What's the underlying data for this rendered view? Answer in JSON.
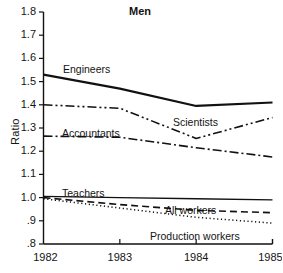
{
  "chart_data": {
    "type": "line",
    "title": "Men",
    "xlabel": "",
    "ylabel": "Ratio",
    "x": [
      1982,
      1983,
      1984,
      1985
    ],
    "xtick_labels": [
      "1982",
      "1983",
      "1984",
      "1985"
    ],
    "ylim": [
      0.8,
      1.8
    ],
    "ytick_values": [
      1.8,
      1.7,
      1.6,
      1.5,
      1.4,
      1.3,
      1.2,
      1.1,
      1.0,
      0.9,
      0.8
    ],
    "ytick_labels": [
      "1.8",
      "1.7",
      "1.6",
      "1.5",
      "1.4",
      "1.3",
      "1.2",
      "1.1",
      "1.0",
      ".9",
      ".8"
    ],
    "grid": false,
    "legend_position": "inline-annotations",
    "series": [
      {
        "name": "Engineers",
        "style": "solid",
        "width": 2.2,
        "values": [
          1.53,
          1.47,
          1.395,
          1.41
        ]
      },
      {
        "name": "Scientists",
        "style": "dash-dot-dot",
        "width": 1.6,
        "values": [
          1.4,
          1.385,
          1.255,
          1.345
        ]
      },
      {
        "name": "Accountants",
        "style": "dash-dot",
        "width": 1.6,
        "values": [
          1.265,
          1.26,
          1.215,
          1.175
        ]
      },
      {
        "name": "Teachers",
        "style": "solid-thin",
        "width": 1.3,
        "values": [
          1.005,
          1.0,
          0.995,
          0.99
        ]
      },
      {
        "name": "All workers",
        "style": "dashed",
        "width": 1.6,
        "values": [
          1.0,
          0.97,
          0.945,
          0.935
        ]
      },
      {
        "name": "Production workers",
        "style": "dotted",
        "width": 1.5,
        "values": [
          0.995,
          0.955,
          0.915,
          0.89
        ]
      }
    ],
    "annotations": [
      {
        "text": "Engineers",
        "x_px": 63,
        "y_px": 64
      },
      {
        "text": "Scientists",
        "x_px": 173,
        "y_px": 117
      },
      {
        "text": "Accountants",
        "x_px": 62,
        "y_px": 128
      },
      {
        "text": "Teachers",
        "x_px": 62,
        "y_px": 188
      },
      {
        "text": "All workers",
        "x_px": 165,
        "y_px": 205
      },
      {
        "text": "Production workers",
        "x_px": 150,
        "y_px": 231
      }
    ],
    "colors": {
      "line": "#111111",
      "axis": "#111111",
      "background": "#ffffff",
      "text": "#141414"
    }
  }
}
